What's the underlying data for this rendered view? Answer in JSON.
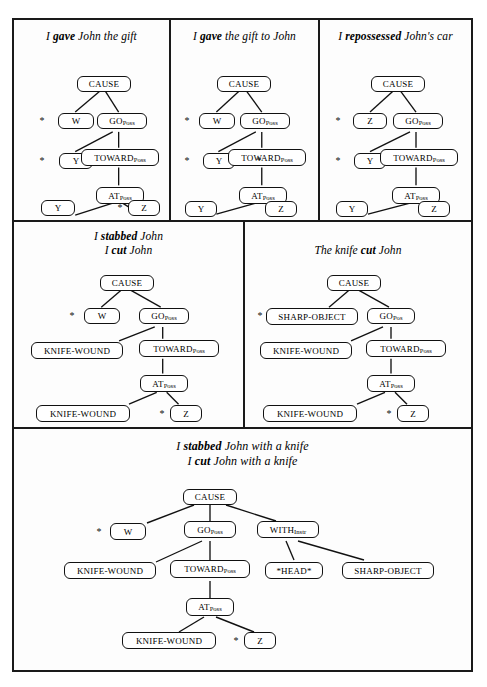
{
  "figure": {
    "caption_style": "italic-serif",
    "background_color": "#ffffff",
    "line_color": "#111111",
    "node_fill": "#ffffff"
  },
  "panels": [
    {
      "id": "give-john",
      "title_parts": {
        "pre": "I ",
        "verb": "gave",
        "post": " John the gift"
      },
      "nodes": [
        {
          "name": "cause",
          "label": "CAUSE",
          "sub": ""
        },
        {
          "name": "w",
          "label": "W",
          "sub": ""
        },
        {
          "name": "go-poss",
          "label": "GO",
          "sub": "Poss"
        },
        {
          "name": "y-mid",
          "label": "Y",
          "sub": ""
        },
        {
          "name": "toward",
          "label": "TOWARD",
          "sub": "Poss"
        },
        {
          "name": "at-poss",
          "label": "AT",
          "sub": "Poss"
        },
        {
          "name": "y-leaf",
          "label": "Y",
          "sub": ""
        },
        {
          "name": "z-leaf",
          "label": "Z",
          "sub": ""
        }
      ],
      "stars": [
        "w",
        "y-mid",
        "z-leaf"
      ]
    },
    {
      "id": "give-to-john",
      "title_parts": {
        "pre": "I ",
        "verb": "gave",
        "post": " the gift to John"
      },
      "nodes": [
        {
          "name": "cause",
          "label": "CAUSE",
          "sub": ""
        },
        {
          "name": "w",
          "label": "W",
          "sub": ""
        },
        {
          "name": "go-poss",
          "label": "GO",
          "sub": "Poss"
        },
        {
          "name": "y-mid",
          "label": "Y",
          "sub": ""
        },
        {
          "name": "toward",
          "label": "TOWARD",
          "sub": "Poss"
        },
        {
          "name": "at-poss",
          "label": "AT",
          "sub": "Poss"
        },
        {
          "name": "y-leaf",
          "label": "Y",
          "sub": ""
        },
        {
          "name": "z-leaf",
          "label": "Z",
          "sub": ""
        }
      ],
      "stars": [
        "w",
        "y-mid",
        "toward"
      ]
    },
    {
      "id": "repossessed",
      "title_parts": {
        "pre": "I ",
        "verb": "repossessed",
        "post": " John's car"
      },
      "nodes": [
        {
          "name": "cause",
          "label": "CAUSE",
          "sub": ""
        },
        {
          "name": "z-top",
          "label": "Z",
          "sub": ""
        },
        {
          "name": "go-poss",
          "label": "GO",
          "sub": "Poss"
        },
        {
          "name": "y-mid",
          "label": "Y",
          "sub": ""
        },
        {
          "name": "toward",
          "label": "TOWARD",
          "sub": "Poss"
        },
        {
          "name": "at-poss",
          "label": "AT",
          "sub": "Poss"
        },
        {
          "name": "y-leaf",
          "label": "Y",
          "sub": ""
        },
        {
          "name": "z-leaf",
          "label": "Z",
          "sub": ""
        }
      ],
      "stars": [
        "z-top",
        "y-mid"
      ]
    },
    {
      "id": "stabbed-cut",
      "title_line1_parts": {
        "pre": "I ",
        "verb": "stabbed",
        "post": " John"
      },
      "title_line2_parts": {
        "pre": "I ",
        "verb": "cut",
        "post": " John"
      },
      "nodes": [
        {
          "name": "cause",
          "label": "CAUSE",
          "sub": ""
        },
        {
          "name": "w",
          "label": "W",
          "sub": ""
        },
        {
          "name": "go-poss",
          "label": "GO",
          "sub": "Poss"
        },
        {
          "name": "knife-1",
          "label": "KNIFE-WOUND",
          "sub": ""
        },
        {
          "name": "toward",
          "label": "TOWARD",
          "sub": "Poss"
        },
        {
          "name": "at-poss",
          "label": "AT",
          "sub": "Poss"
        },
        {
          "name": "knife-2",
          "label": "KNIFE-WOUND",
          "sub": ""
        },
        {
          "name": "z-leaf",
          "label": "Z",
          "sub": ""
        }
      ],
      "stars": [
        "w",
        "z-leaf"
      ]
    },
    {
      "id": "knife-cut",
      "title_parts": {
        "pre": "The knife ",
        "verb": "cut",
        "post": " John"
      },
      "nodes": [
        {
          "name": "cause",
          "label": "CAUSE",
          "sub": ""
        },
        {
          "name": "sharp-object",
          "label": "SHARP-OBJECT",
          "sub": ""
        },
        {
          "name": "go-pos",
          "label": "GO",
          "sub": "Pos"
        },
        {
          "name": "knife-1",
          "label": "KNIFE-WOUND",
          "sub": ""
        },
        {
          "name": "toward",
          "label": "TOWARD",
          "sub": "Poss"
        },
        {
          "name": "at-poss",
          "label": "AT",
          "sub": "Poss"
        },
        {
          "name": "knife-2",
          "label": "KNIFE-WOUND",
          "sub": ""
        },
        {
          "name": "z-leaf",
          "label": "Z",
          "sub": ""
        }
      ],
      "stars": [
        "sharp-object",
        "z-leaf"
      ]
    },
    {
      "id": "with-knife",
      "title_line1_parts": {
        "pre": "I ",
        "verb": "stabbed",
        "post": " John with a knife"
      },
      "title_line2_parts": {
        "pre": "I ",
        "verb": "cut",
        "post": " John with a knife"
      },
      "nodes": [
        {
          "name": "cause",
          "label": "CAUSE",
          "sub": ""
        },
        {
          "name": "w",
          "label": "W",
          "sub": ""
        },
        {
          "name": "go-poss",
          "label": "GO",
          "sub": "Poss"
        },
        {
          "name": "with-instr",
          "label": "WITH",
          "sub": "Instr"
        },
        {
          "name": "knife-1",
          "label": "KNIFE-WOUND",
          "sub": ""
        },
        {
          "name": "toward",
          "label": "TOWARD",
          "sub": "Poss"
        },
        {
          "name": "head",
          "label": "*HEAD*",
          "sub": ""
        },
        {
          "name": "sharp-object",
          "label": "SHARP-OBJECT",
          "sub": ""
        },
        {
          "name": "at-poss",
          "label": "AT",
          "sub": "Poss"
        },
        {
          "name": "knife-2",
          "label": "KNIFE-WOUND",
          "sub": ""
        },
        {
          "name": "z-leaf",
          "label": "Z",
          "sub": ""
        }
      ],
      "stars": [
        "w",
        "z-leaf"
      ]
    }
  ],
  "star_glyph": "*"
}
